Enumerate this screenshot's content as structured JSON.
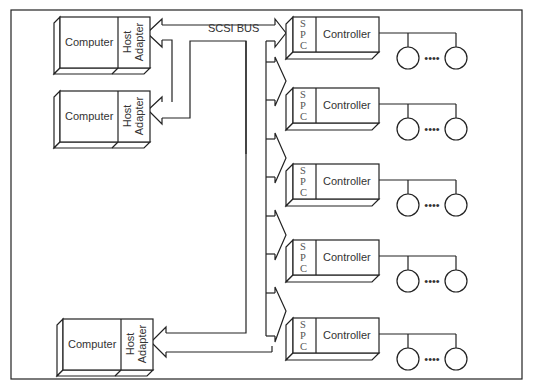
{
  "diagram": {
    "bus_label": "SCSI BUS",
    "computers": [
      {
        "label": "Computer",
        "adapter_line1": "Host",
        "adapter_line2": "Adapter"
      },
      {
        "label": "Computer",
        "adapter_line1": "Host",
        "adapter_line2": "Adapter"
      },
      {
        "label": "Computer",
        "adapter_line1": "Host",
        "adapter_line2": "Adapter"
      }
    ],
    "controllers": [
      {
        "spc": [
          "S",
          "P",
          "C"
        ],
        "label": "Controller",
        "devices_ellipsis": "••••"
      },
      {
        "spc": [
          "S",
          "P",
          "C"
        ],
        "label": "Controller",
        "devices_ellipsis": "••••"
      },
      {
        "spc": [
          "S",
          "P",
          "C"
        ],
        "label": "Controller",
        "devices_ellipsis": "••••"
      },
      {
        "spc": [
          "S",
          "P",
          "C"
        ],
        "label": "Controller",
        "devices_ellipsis": "••••"
      },
      {
        "spc": [
          "S",
          "P",
          "C"
        ],
        "label": "Controller",
        "devices_ellipsis": "••••"
      }
    ]
  }
}
